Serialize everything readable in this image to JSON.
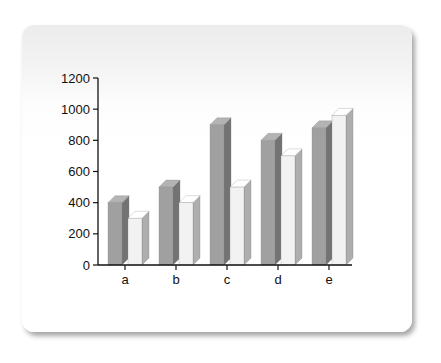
{
  "chart_data": {
    "type": "bar",
    "title": "",
    "xlabel": "",
    "ylabel": "",
    "categories": [
      "a",
      "b",
      "c",
      "d",
      "e"
    ],
    "series": [
      {
        "name": "series-1",
        "color": "#a0a0a0",
        "values": [
          400,
          500,
          900,
          800,
          880
        ]
      },
      {
        "name": "series-2",
        "color": "#f2f2f2",
        "values": [
          300,
          400,
          500,
          700,
          960
        ]
      }
    ],
    "ylim": [
      0,
      1200
    ],
    "yticks": [
      0,
      200,
      400,
      600,
      800,
      1000,
      1200
    ],
    "grid": false,
    "legend": "none",
    "style": "3d-clustered"
  }
}
